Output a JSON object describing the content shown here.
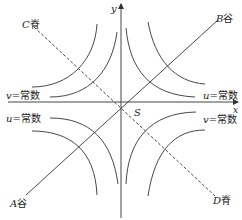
{
  "diagram": {
    "axes": {
      "x_label": "x",
      "y_label": "y",
      "origin_label": "S"
    },
    "lines": {
      "ridge_C": {
        "letter": "C",
        "suffix": "脊"
      },
      "valley_B": {
        "letter": "B",
        "suffix": "谷"
      },
      "valley_A": {
        "letter": "A",
        "suffix": "谷"
      },
      "ridge_D": {
        "letter": "D",
        "suffix": "脊"
      }
    },
    "curve_labels": {
      "top_left": {
        "var": "v",
        "text": "=常数"
      },
      "top_right": {
        "var": "u",
        "text": "=常数"
      },
      "bottom_left": {
        "var": "u",
        "text": "=常数"
      },
      "bottom_right": {
        "var": "v",
        "text": "=常数"
      }
    },
    "colors": {
      "stroke": "#333333",
      "background": "#ffffff"
    }
  }
}
